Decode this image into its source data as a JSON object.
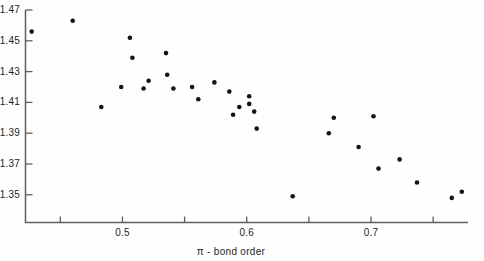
{
  "figure": {
    "background_color": "#fefefe",
    "dot_color": "#141414",
    "axis_color": "#5f5f5f",
    "text_color": "#1f1f1f"
  },
  "chart_data": {
    "type": "scatter",
    "title": "",
    "xlabel": "π - bond order",
    "ylabel": "",
    "grid": false,
    "legend": "none",
    "xlim": [
      0.422,
      0.778
    ],
    "ylim": [
      1.332,
      1.47
    ],
    "x_ticks": [
      0.45,
      0.5,
      0.55,
      0.6,
      0.65,
      0.7,
      0.75
    ],
    "x_tick_labels": [
      "",
      "0.5",
      "",
      "0.6",
      "",
      "0.7",
      ""
    ],
    "y_ticks": [
      1.47,
      1.45,
      1.43,
      1.41,
      1.39,
      1.37,
      1.35
    ],
    "y_tick_labels": [
      "1.47",
      "1.45",
      "1.43",
      "1.41",
      "1.39",
      "1.37",
      "1.35"
    ],
    "points": [
      [
        0.427,
        1.456
      ],
      [
        0.46,
        1.463
      ],
      [
        0.483,
        1.407
      ],
      [
        0.499,
        1.42
      ],
      [
        0.506,
        1.452
      ],
      [
        0.508,
        1.439
      ],
      [
        0.517,
        1.419
      ],
      [
        0.521,
        1.424
      ],
      [
        0.535,
        1.442
      ],
      [
        0.536,
        1.428
      ],
      [
        0.541,
        1.419
      ],
      [
        0.556,
        1.42
      ],
      [
        0.561,
        1.412
      ],
      [
        0.574,
        1.423
      ],
      [
        0.586,
        1.417
      ],
      [
        0.589,
        1.402
      ],
      [
        0.594,
        1.407
      ],
      [
        0.602,
        1.414
      ],
      [
        0.602,
        1.409
      ],
      [
        0.606,
        1.404
      ],
      [
        0.608,
        1.393
      ],
      [
        0.637,
        1.349
      ],
      [
        0.666,
        1.39
      ],
      [
        0.67,
        1.4
      ],
      [
        0.69,
        1.381
      ],
      [
        0.702,
        1.401
      ],
      [
        0.706,
        1.367
      ],
      [
        0.723,
        1.373
      ],
      [
        0.737,
        1.358
      ],
      [
        0.765,
        1.348
      ],
      [
        0.773,
        1.352
      ]
    ]
  }
}
